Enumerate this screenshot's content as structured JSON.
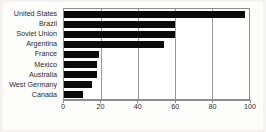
{
  "chart_data": {
    "type": "bar",
    "orientation": "horizontal",
    "title": "",
    "subtitle": "",
    "xlabel": "",
    "ylabel": "",
    "categories": [
      "United States",
      "Brazil",
      "Soviet Union",
      "Argentina",
      "France",
      "Mexico",
      "Australia",
      "West Germany",
      "Canada"
    ],
    "values": [
      98,
      60,
      60,
      54,
      19,
      18,
      18,
      15,
      10
    ],
    "xlim": [
      0,
      100
    ],
    "xticks": [
      0,
      20,
      40,
      60,
      80,
      100
    ],
    "xticklabels": [
      "0",
      "20",
      "40",
      "60",
      "80",
      "100"
    ],
    "grid": true,
    "grid_axis": "x",
    "legend": false,
    "legend_position": "none",
    "bar_color": "#0a0a0a",
    "frame_color": "#8d8d8d",
    "background_color": "#ffffff",
    "page_background_color": "#f2f1ef"
  }
}
